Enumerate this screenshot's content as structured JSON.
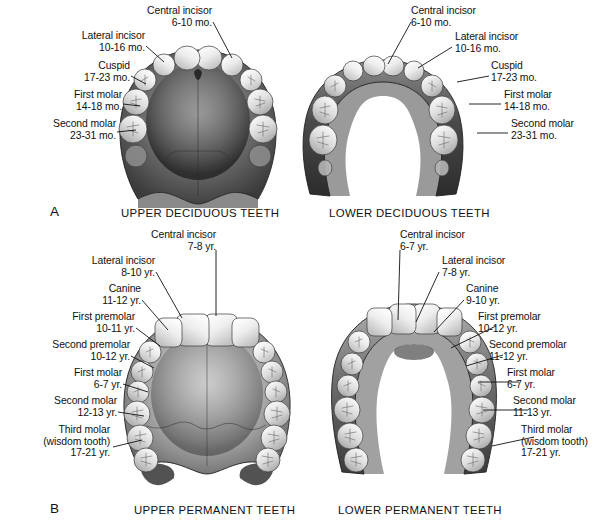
{
  "figure": {
    "background_color": "#ffffff",
    "ink_color": "#111111"
  },
  "panels": [
    {
      "letter": "A",
      "charts": [
        {
          "caption": "UPPER DECIDUOUS TEETH",
          "arch": "maxilla",
          "dentition": "deciduous",
          "tooth_count": 10,
          "labels": [
            {
              "name": "Central incisor",
              "age": "6-10 mo.",
              "side": "top"
            },
            {
              "name": "Lateral incisor",
              "age": "10-16 mo.",
              "side": "left"
            },
            {
              "name": "Cuspid",
              "age": "17-23 mo.",
              "side": "left"
            },
            {
              "name": "First molar",
              "age": "14-18 mo.",
              "side": "left"
            },
            {
              "name": "Second molar",
              "age": "23-31 mo.",
              "side": "left"
            }
          ]
        },
        {
          "caption": "LOWER DECIDUOUS TEETH",
          "arch": "mandible",
          "dentition": "deciduous",
          "tooth_count": 10,
          "labels": [
            {
              "name": "Central incisor",
              "age": "6-10 mo.",
              "side": "top"
            },
            {
              "name": "Lateral incisor",
              "age": "10-16 mo.",
              "side": "right"
            },
            {
              "name": "Cuspid",
              "age": "17-23 mo.",
              "side": "right"
            },
            {
              "name": "First molar",
              "age": "14-18 mo.",
              "side": "right"
            },
            {
              "name": "Second molar",
              "age": "23-31 mo.",
              "side": "right"
            }
          ]
        }
      ]
    },
    {
      "letter": "B",
      "charts": [
        {
          "caption": "UPPER PERMANENT TEETH",
          "arch": "maxilla",
          "dentition": "permanent",
          "tooth_count": 16,
          "labels": [
            {
              "name": "Central incisor",
              "age": "7-8 yr.",
              "side": "top"
            },
            {
              "name": "Lateral incisor",
              "age": "8-10 yr.",
              "side": "left"
            },
            {
              "name": "Canine",
              "age": "11-12 yr.",
              "side": "left"
            },
            {
              "name": "First premolar",
              "age": "10-11 yr.",
              "side": "left"
            },
            {
              "name": "Second premolar",
              "age": "10-12 yr.",
              "side": "left"
            },
            {
              "name": "First molar",
              "age": "6-7 yr.",
              "side": "left"
            },
            {
              "name": "Second molar",
              "age": "12-13 yr.",
              "side": "left"
            },
            {
              "name": "Third molar",
              "name2": "(wisdom tooth)",
              "age": "17-21 yr.",
              "side": "left"
            }
          ]
        },
        {
          "caption": "LOWER PERMANENT TEETH",
          "arch": "mandible",
          "dentition": "permanent",
          "tooth_count": 16,
          "labels": [
            {
              "name": "Central incisor",
              "age": "6-7 yr.",
              "side": "top"
            },
            {
              "name": "Lateral incisor",
              "age": "7-8 yr.",
              "side": "right"
            },
            {
              "name": "Canine",
              "age": "9-10 yr.",
              "side": "right"
            },
            {
              "name": "First premolar",
              "age": "10-12 yr.",
              "side": "right"
            },
            {
              "name": "Second premolar",
              "age": "11-12 yr.",
              "side": "right"
            },
            {
              "name": "First molar",
              "age": "6-7 yr.",
              "side": "right"
            },
            {
              "name": "Second molar",
              "age": "11-13 yr.",
              "side": "right"
            },
            {
              "name": "Third molar",
              "name2": "(wisdom tooth)",
              "age": "17-21 yr.",
              "side": "right"
            }
          ]
        }
      ]
    }
  ],
  "a_upper": {
    "central_name": "Central incisor",
    "central_age": "6-10 mo.",
    "lateral_name": "Lateral incisor",
    "lateral_age": "10-16 mo.",
    "cuspid_name": "Cuspid",
    "cuspid_age": "17-23 mo.",
    "molar1_name": "First molar",
    "molar1_age": "14-18 mo.",
    "molar2_name": "Second molar",
    "molar2_age": "23-31 mo.",
    "caption": "UPPER DECIDUOUS TEETH"
  },
  "a_lower": {
    "central_name": "Central incisor",
    "central_age": "6-10 mo.",
    "lateral_name": "Lateral incisor",
    "lateral_age": "10-16 mo.",
    "cuspid_name": "Cuspid",
    "cuspid_age": "17-23 mo.",
    "molar1_name": "First molar",
    "molar1_age": "14-18 mo.",
    "molar2_name": "Second molar",
    "molar2_age": "23-31 mo.",
    "caption": "LOWER DECIDUOUS TEETH"
  },
  "b_upper": {
    "central_name": "Central incisor",
    "central_age": "7-8 yr.",
    "lateral_name": "Lateral incisor",
    "lateral_age": "8-10 yr.",
    "canine_name": "Canine",
    "canine_age": "11-12 yr.",
    "premolar1_name": "First premolar",
    "premolar1_age": "10-11 yr.",
    "premolar2_name": "Second premolar",
    "premolar2_age": "10-12 yr.",
    "molar1_name": "First molar",
    "molar1_age": "6-7 yr.",
    "molar2_name": "Second molar",
    "molar2_age": "12-13 yr.",
    "molar3_name": "Third molar",
    "molar3_name2": "(wisdom tooth)",
    "molar3_age": "17-21 yr.",
    "caption": "UPPER PERMANENT TEETH"
  },
  "b_lower": {
    "central_name": "Central incisor",
    "central_age": "6-7 yr.",
    "lateral_name": "Lateral incisor",
    "lateral_age": "7-8 yr.",
    "canine_name": "Canine",
    "canine_age": "9-10 yr.",
    "premolar1_name": "First premolar",
    "premolar1_age": "10-12 yr.",
    "premolar2_name": "Second premolar",
    "premolar2_age": "11-12 yr.",
    "molar1_name": "First molar",
    "molar1_age": "6-7 yr.",
    "molar2_name": "Second molar",
    "molar2_age": "11-13 yr.",
    "molar3_name": "Third molar",
    "molar3_name2": "(wisdom tooth)",
    "molar3_age": "17-21 yr.",
    "caption": "LOWER PERMANENT TEETH"
  },
  "letters": {
    "a": "A",
    "b": "B"
  }
}
